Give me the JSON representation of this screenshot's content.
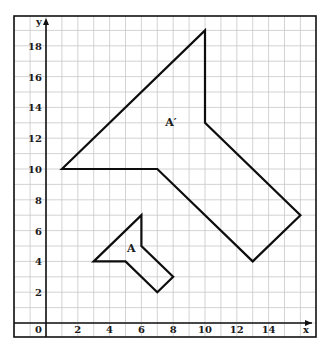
{
  "diagram": {
    "type": "coordinate-grid-transformation",
    "axes": {
      "x_label": "x",
      "y_label": "y",
      "origin_label": "0",
      "x_ticks": [
        "2",
        "4",
        "6",
        "8",
        "10",
        "12",
        "14"
      ],
      "y_ticks": [
        "2",
        "4",
        "6",
        "8",
        "10",
        "12",
        "14",
        "16",
        "18"
      ],
      "x_range": [
        -2,
        17
      ],
      "y_range": [
        -1,
        20
      ]
    },
    "shapes": [
      {
        "name": "A",
        "label": "A",
        "label_pos": [
          5.1,
          4.6
        ],
        "vertices": [
          [
            3,
            4
          ],
          [
            6,
            7
          ],
          [
            6,
            5
          ],
          [
            8,
            3
          ],
          [
            7,
            2
          ],
          [
            5,
            4
          ]
        ]
      },
      {
        "name": "A-prime",
        "label": "A′",
        "label_pos": [
          7.5,
          12.8
        ],
        "vertices": [
          [
            1,
            10
          ],
          [
            10,
            19
          ],
          [
            10,
            13
          ],
          [
            16,
            7
          ],
          [
            13,
            4
          ],
          [
            7,
            10
          ]
        ]
      }
    ],
    "colors": {
      "grid": "#c8c8c8",
      "axis": "#111111",
      "shape_stroke": "#0d0d0d",
      "background": "#ffffff"
    }
  }
}
